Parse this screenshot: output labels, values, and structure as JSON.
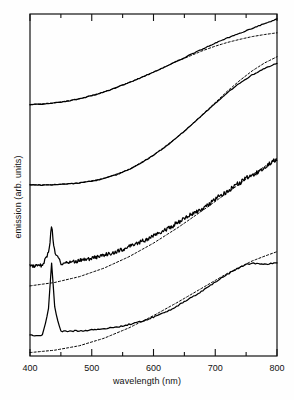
{
  "figure": {
    "xlabel": "wavelength (nm)",
    "ylabel": "emission (arb. units)",
    "background_color": "#fefefe",
    "line_color": "#000000",
    "fit_color": "#000000"
  },
  "axes": {
    "x_tick_labels": [
      "400",
      "500",
      "600",
      "700",
      "800"
    ],
    "x_major_ticks": [
      400,
      500,
      600,
      700,
      800
    ],
    "x_minor_ticks": [
      450,
      550,
      650,
      750
    ],
    "y_tick_labels": []
  },
  "chart_data": {
    "type": "line",
    "title": "",
    "xlabel": "wavelength (nm)",
    "ylabel": "emission (arb. units)",
    "xlim": [
      400,
      800
    ],
    "ylim": [
      0,
      1
    ],
    "grid": false,
    "legend": "none",
    "note": "Four vertically offset emission spectra; each solid measured spectrum is paired with a dashed model fit curve. Y axis is arbitrary units with no tick labels.",
    "series": [
      {
        "name": "spectrum-1-measured",
        "style": "solid",
        "offset_index": 0,
        "x": [
          400,
          420,
          440,
          460,
          480,
          500,
          520,
          540,
          560,
          580,
          600,
          620,
          640,
          660,
          680,
          700,
          720,
          740,
          750,
          760,
          770,
          780,
          790,
          800
        ],
        "y": [
          0.735,
          0.737,
          0.74,
          0.745,
          0.752,
          0.761,
          0.772,
          0.785,
          0.799,
          0.814,
          0.83,
          0.847,
          0.864,
          0.881,
          0.898,
          0.915,
          0.93,
          0.944,
          0.951,
          0.958,
          0.965,
          0.972,
          0.978,
          0.985
        ]
      },
      {
        "name": "spectrum-1-fit",
        "style": "dashed",
        "offset_index": 0,
        "x": [
          400,
          440,
          480,
          520,
          560,
          600,
          640,
          680,
          700,
          720,
          740,
          760,
          780,
          800
        ],
        "y": [
          0.735,
          0.74,
          0.752,
          0.772,
          0.799,
          0.83,
          0.863,
          0.893,
          0.906,
          0.917,
          0.926,
          0.934,
          0.94,
          0.945
        ]
      },
      {
        "name": "spectrum-2-measured",
        "style": "solid",
        "offset_index": 1,
        "x": [
          400,
          420,
          440,
          460,
          480,
          500,
          520,
          540,
          560,
          580,
          600,
          620,
          640,
          660,
          680,
          700,
          720,
          740,
          760,
          780,
          800
        ],
        "y": [
          0.5,
          0.5,
          0.501,
          0.503,
          0.506,
          0.511,
          0.519,
          0.53,
          0.545,
          0.564,
          0.587,
          0.613,
          0.642,
          0.673,
          0.706,
          0.739,
          0.77,
          0.798,
          0.822,
          0.841,
          0.856
        ]
      },
      {
        "name": "spectrum-2-fit",
        "style": "dashed",
        "offset_index": 1,
        "x": [
          400,
          440,
          480,
          520,
          560,
          600,
          640,
          680,
          700,
          720,
          740,
          760,
          780,
          800
        ],
        "y": [
          0.5,
          0.501,
          0.506,
          0.519,
          0.545,
          0.587,
          0.642,
          0.706,
          0.741,
          0.775,
          0.806,
          0.834,
          0.857,
          0.875
        ]
      },
      {
        "name": "spectrum-3-measured",
        "style": "solid-noisy",
        "offset_index": 2,
        "peak_center_nm": 435,
        "peak_height": 0.055,
        "noise_amplitude": 0.012,
        "x": [
          400,
          420,
          435,
          450,
          470,
          490,
          510,
          530,
          550,
          570,
          590,
          610,
          630,
          650,
          670,
          690,
          710,
          730,
          750,
          770,
          790,
          800
        ],
        "y": [
          0.262,
          0.264,
          0.318,
          0.272,
          0.276,
          0.282,
          0.29,
          0.3,
          0.312,
          0.326,
          0.342,
          0.36,
          0.38,
          0.401,
          0.423,
          0.446,
          0.47,
          0.494,
          0.518,
          0.542,
          0.565,
          0.576
        ]
      },
      {
        "name": "spectrum-3-fit",
        "style": "dashed",
        "offset_index": 2,
        "x": [
          400,
          440,
          480,
          520,
          560,
          600,
          640,
          680,
          720,
          760,
          800
        ],
        "y": [
          0.205,
          0.215,
          0.232,
          0.257,
          0.29,
          0.33,
          0.376,
          0.426,
          0.478,
          0.53,
          0.578
        ]
      },
      {
        "name": "spectrum-4-measured",
        "style": "solid",
        "offset_index": 3,
        "peak_center_nm": 435,
        "peak_height": 0.105,
        "x": [
          400,
          420,
          435,
          450,
          470,
          490,
          510,
          530,
          550,
          570,
          590,
          610,
          630,
          650,
          670,
          690,
          710,
          730,
          750,
          760,
          775,
          790,
          800
        ],
        "y": [
          0.06,
          0.061,
          0.168,
          0.072,
          0.073,
          0.075,
          0.078,
          0.082,
          0.088,
          0.096,
          0.107,
          0.121,
          0.138,
          0.158,
          0.18,
          0.204,
          0.228,
          0.25,
          0.268,
          0.272,
          0.268,
          0.27,
          0.272
        ]
      },
      {
        "name": "spectrum-4-fit",
        "style": "dashed",
        "offset_index": 3,
        "x": [
          400,
          440,
          480,
          520,
          560,
          600,
          640,
          680,
          720,
          760,
          780,
          800
        ],
        "y": [
          0.01,
          0.017,
          0.03,
          0.052,
          0.082,
          0.118,
          0.158,
          0.2,
          0.242,
          0.278,
          0.292,
          0.305
        ]
      }
    ]
  }
}
